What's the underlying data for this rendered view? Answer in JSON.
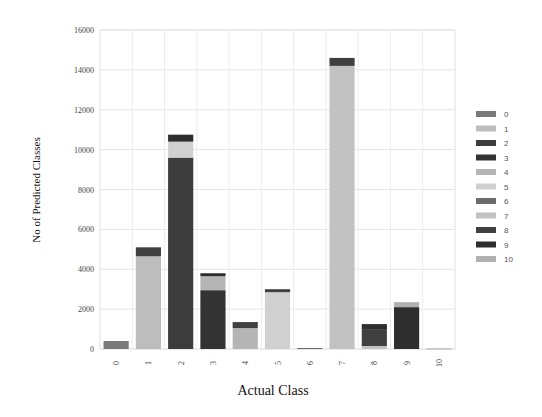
{
  "chart_data": {
    "type": "bar",
    "stacked": true,
    "title": "",
    "xlabel": "Actual Class",
    "ylabel": "No of Predicted Classes",
    "ylim": [
      0,
      16000
    ],
    "yticks": [
      0,
      2000,
      4000,
      6000,
      8000,
      10000,
      12000,
      14000,
      16000
    ],
    "grid": true,
    "legend_position": "right",
    "categories": [
      "0",
      "1",
      "2",
      "3",
      "4",
      "5",
      "6",
      "7",
      "8",
      "9",
      "10"
    ],
    "series": [
      {
        "name": "0",
        "color": "#7a7a7a",
        "values": [
          400,
          0,
          0,
          0,
          0,
          0,
          0,
          0,
          0,
          0,
          0
        ]
      },
      {
        "name": "1",
        "color": "#bdbdbd",
        "values": [
          0,
          4650,
          0,
          0,
          0,
          0,
          0,
          0,
          0,
          0,
          0
        ]
      },
      {
        "name": "2",
        "color": "#3c3c3c",
        "values": [
          0,
          0,
          9600,
          0,
          0,
          0,
          0,
          0,
          0,
          0,
          0
        ]
      },
      {
        "name": "3",
        "color": "#333333",
        "values": [
          0,
          0,
          0,
          2950,
          0,
          0,
          0,
          0,
          0,
          0,
          0
        ]
      },
      {
        "name": "4",
        "color": "#b5b5b5",
        "values": [
          0,
          0,
          0,
          700,
          1050,
          0,
          0,
          0,
          0,
          0,
          0
        ]
      },
      {
        "name": "5",
        "color": "#d0d0d0",
        "values": [
          0,
          0,
          800,
          0,
          0,
          2850,
          0,
          0,
          0,
          0,
          0
        ]
      },
      {
        "name": "6",
        "color": "#6b6b6b",
        "values": [
          0,
          0,
          0,
          0,
          0,
          0,
          50,
          0,
          0,
          0,
          0
        ]
      },
      {
        "name": "7",
        "color": "#c2c2c2",
        "values": [
          0,
          0,
          0,
          0,
          0,
          0,
          0,
          14200,
          150,
          0,
          0
        ]
      },
      {
        "name": "8",
        "color": "#404040",
        "values": [
          0,
          450,
          0,
          0,
          300,
          150,
          0,
          400,
          850,
          0,
          0
        ]
      },
      {
        "name": "9",
        "color": "#2e2e2e",
        "values": [
          0,
          0,
          350,
          150,
          0,
          0,
          0,
          0,
          250,
          2100,
          0
        ]
      },
      {
        "name": "10",
        "color": "#b0b0b0",
        "values": [
          0,
          0,
          0,
          0,
          0,
          0,
          0,
          0,
          0,
          250,
          30
        ]
      }
    ]
  }
}
